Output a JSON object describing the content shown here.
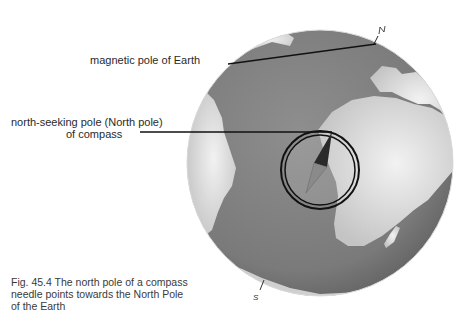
{
  "labels": {
    "magnetic_pole": "magnetic pole of Earth",
    "north_seeking_line1": "north-seeking pole (North pole)",
    "north_seeking_line2": "of compass",
    "pole_n": "N",
    "pole_s": "S"
  },
  "caption": {
    "line1": "Fig. 45.4  The  north pole of a compass",
    "line2": "needle points towards the North Pole",
    "line3": "of the Earth"
  },
  "colors": {
    "ocean": "#7d7d7d",
    "land": "#d8d8d8",
    "outline": "#1a1a1a"
  }
}
